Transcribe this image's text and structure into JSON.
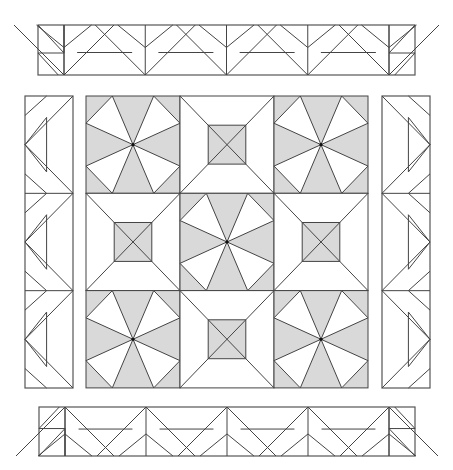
{
  "diagram": {
    "type": "quilt-pattern",
    "colors": {
      "shade": "#d9d9d9",
      "line": "#444444",
      "background": "#ffffff"
    },
    "center_grid": {
      "x": 86,
      "y": 96,
      "cols": 3,
      "rows": 3,
      "block_w": 94,
      "block_h": 97.3,
      "layout": [
        [
          "pinwheel",
          "square-in-square",
          "pinwheel"
        ],
        [
          "square-in-square",
          "pinwheel",
          "square-in-square"
        ],
        [
          "pinwheel",
          "square-in-square",
          "pinwheel"
        ]
      ]
    },
    "borders": {
      "top": {
        "x": 38,
        "y": 25,
        "w": 377,
        "h": 50,
        "orientation": "horizontal",
        "pointing": "down"
      },
      "bottom": {
        "x": 39,
        "y": 407,
        "w": 376,
        "h": 49,
        "orientation": "horizontal",
        "pointing": "up"
      },
      "left": {
        "x": 25,
        "y": 96,
        "w": 48,
        "h": 292,
        "orientation": "vertical",
        "pointing": "left"
      },
      "right": {
        "x": 382,
        "y": 96,
        "w": 48,
        "h": 292,
        "orientation": "vertical",
        "pointing": "right"
      }
    }
  }
}
